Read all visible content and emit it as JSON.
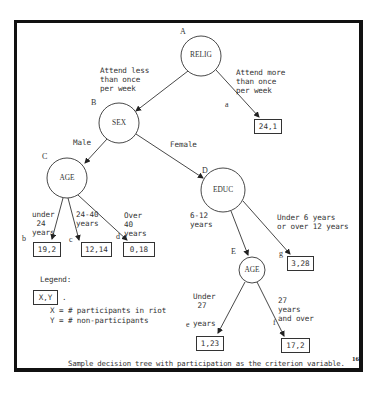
{
  "figure": {
    "caption": "Sample decision tree with participation as the criterion variable.",
    "page_mark": "16"
  },
  "nodes": {
    "A": {
      "letter": "A",
      "label": "RELIG"
    },
    "B": {
      "letter": "B",
      "label": "SEX"
    },
    "C": {
      "letter": "C",
      "label": "AGE"
    },
    "D": {
      "letter": "D",
      "label": "EDUC"
    },
    "E": {
      "letter": "E",
      "label": "AGE"
    }
  },
  "branches": {
    "relig_less": "Attend less\nthan once\nper week",
    "relig_more": "Attend more\nthan once\nper week",
    "sex_male": "Male",
    "sex_female": "Female",
    "age_under24": "under\n 24\nyears",
    "age_24_40": "24-40\nyears",
    "age_over40": "Over\n40\nyears",
    "educ_6_12": "6-12\nyears",
    "educ_other": "Under 6 years\nor over 12 years",
    "age_under27": "Under\n 27\n\nyears",
    "age_27_over": "27\nyears\nand over"
  },
  "leaves": {
    "a": {
      "letter": "a",
      "value": "24,1",
      "participants": 24,
      "non_participants": 1
    },
    "b": {
      "letter": "b",
      "value": "19,2",
      "participants": 19,
      "non_participants": 2
    },
    "c": {
      "letter": "c",
      "value": "12,14",
      "participants": 12,
      "non_participants": 14
    },
    "d": {
      "letter": "d",
      "value": "0,18",
      "participants": 0,
      "non_participants": 18
    },
    "e": {
      "letter": "e",
      "value": "1,23",
      "participants": 1,
      "non_participants": 23
    },
    "f": {
      "letter": "f",
      "value": "17,2",
      "participants": 17,
      "non_participants": 2
    },
    "g": {
      "letter": "g",
      "value": "3,28",
      "participants": 3,
      "non_participants": 28
    }
  },
  "legend": {
    "title": "Legend:",
    "sample_box": "X,Y",
    "dot": ".",
    "line1": "X = # participants in riot",
    "line2": "Y = # non-participants"
  }
}
